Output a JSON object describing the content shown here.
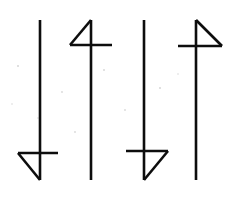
{
  "image": {
    "title": "Four hand-drawn arrow-like glyph figures",
    "width": 225,
    "height": 200,
    "background_color": "#ffffff",
    "ink_color": "#0d0d0d",
    "stroke_width": 2.6,
    "caption": ""
  },
  "figures": [
    {
      "id": "figure-1",
      "name": "down-arrow-left-barb",
      "description": "Vertical line with horizontal crossbar near the bottom and a diagonal forming a triangle open to the left",
      "shaft": {
        "x": 40,
        "y_top": 20,
        "y_bottom": 180
      },
      "crossbar": {
        "y": 153,
        "x_left": 18,
        "x_right": 58
      },
      "diagonal": {
        "x1": 18,
        "y1": 153,
        "x2": 40,
        "y2": 180
      },
      "barb_side": "left",
      "barb_position": "bottom"
    },
    {
      "id": "figure-2",
      "name": "up-arrow-left-barb",
      "description": "Vertical line with horizontal crossbar near the top and a diagonal from the top of the shaft down-left, resembling the numeral four",
      "shaft": {
        "x": 91,
        "y_top": 20,
        "y_bottom": 180
      },
      "crossbar": {
        "y": 45,
        "x_left": 70,
        "x_right": 112
      },
      "diagonal": {
        "x1": 91,
        "y1": 20,
        "x2": 70,
        "y2": 45
      },
      "barb_side": "left",
      "barb_position": "top"
    },
    {
      "id": "figure-3",
      "name": "down-arrow-right-barb",
      "description": "Vertical line with horizontal crossbar near the bottom and a diagonal forming a triangle open to the right",
      "shaft": {
        "x": 144,
        "y_top": 20,
        "y_bottom": 180
      },
      "crossbar": {
        "y": 151,
        "x_left": 126,
        "x_right": 168
      },
      "diagonal": {
        "x1": 168,
        "y1": 151,
        "x2": 144,
        "y2": 180
      },
      "barb_side": "right",
      "barb_position": "bottom"
    },
    {
      "id": "figure-4",
      "name": "up-arrow-right-barb",
      "description": "Vertical line with horizontal crossbar near the top and a diagonal from the top of the shaft down-right, a mirrored numeral four",
      "shaft": {
        "x": 196,
        "y_top": 20,
        "y_bottom": 180
      },
      "crossbar": {
        "y": 46,
        "x_left": 178,
        "x_right": 222
      },
      "diagonal": {
        "x1": 196,
        "y1": 20,
        "x2": 222,
        "y2": 46
      },
      "barb_side": "right",
      "barb_position": "top"
    }
  ],
  "specks": [
    {
      "x": 18,
      "y": 66,
      "r": 1.1
    },
    {
      "x": 62,
      "y": 92,
      "r": 0.9
    },
    {
      "x": 104,
      "y": 70,
      "r": 1.0
    },
    {
      "x": 125,
      "y": 110,
      "r": 0.9
    },
    {
      "x": 160,
      "y": 88,
      "r": 1.1
    },
    {
      "x": 196,
      "y": 120,
      "r": 0.9
    },
    {
      "x": 75,
      "y": 132,
      "r": 0.9
    },
    {
      "x": 38,
      "y": 118,
      "r": 0.8
    },
    {
      "x": 178,
      "y": 74,
      "r": 0.8
    },
    {
      "x": 12,
      "y": 104,
      "r": 0.8
    }
  ]
}
